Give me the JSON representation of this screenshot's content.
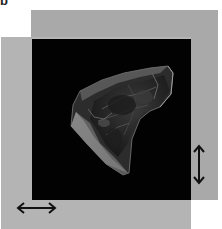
{
  "figure": {
    "panel_label": "b",
    "background_color": "#ffffff",
    "panels": {
      "back_panel_color": "#a9a9a9",
      "front_panel_color": "#b4b4b4",
      "viewport_color": "#020202"
    },
    "render": {
      "subject": "3d-volume-rendering",
      "description": "Translucent 3D rendered specimen on black background"
    },
    "arrows": [
      {
        "name": "horizontal-double-arrow",
        "orientation": "horizontal"
      },
      {
        "name": "vertical-double-arrow",
        "orientation": "vertical"
      }
    ]
  }
}
